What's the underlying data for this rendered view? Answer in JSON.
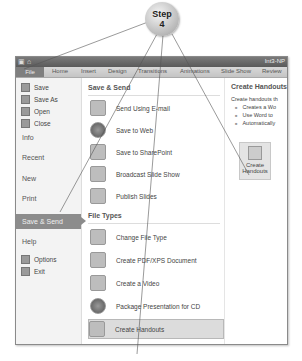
{
  "callout": {
    "line1": "Step",
    "line2": "4"
  },
  "window": {
    "title": "Int3-NP",
    "tabs": [
      "File",
      "Home",
      "Insert",
      "Design",
      "Transitions",
      "Animations",
      "Slide Show",
      "Review"
    ]
  },
  "sidebar": {
    "small_items": [
      {
        "label": "Save",
        "icon": "save-icon"
      },
      {
        "label": "Save As",
        "icon": "save-as-icon"
      },
      {
        "label": "Open",
        "icon": "open-folder-icon"
      },
      {
        "label": "Close",
        "icon": "close-file-icon"
      }
    ],
    "big_items": [
      "Info",
      "Recent",
      "New",
      "Print"
    ],
    "active_item": "Save & Send",
    "help": "Help",
    "bottom_items": [
      {
        "label": "Options",
        "icon": "options-icon"
      },
      {
        "label": "Exit",
        "icon": "exit-icon"
      }
    ]
  },
  "middle": {
    "save_send_heading": "Save & Send",
    "save_send_items": [
      {
        "label": "Send Using E-mail",
        "icon": "email-icon"
      },
      {
        "label": "Save to Web",
        "icon": "web-globe-icon"
      },
      {
        "label": "Save to SharePoint",
        "icon": "sharepoint-icon"
      },
      {
        "label": "Broadcast Slide Show",
        "icon": "broadcast-icon"
      },
      {
        "label": "Publish Slides",
        "icon": "publish-slides-icon"
      }
    ],
    "file_types_heading": "File Types",
    "file_types_items": [
      {
        "label": "Change File Type",
        "icon": "change-file-type-icon"
      },
      {
        "label": "Create PDF/XPS Document",
        "icon": "pdf-icon"
      },
      {
        "label": "Create a Video",
        "icon": "video-icon"
      },
      {
        "label": "Package Presentation for CD",
        "icon": "cd-icon"
      },
      {
        "label": "Create Handouts",
        "icon": "handouts-icon",
        "selected": true
      }
    ]
  },
  "right": {
    "title": "Create Handouts",
    "description": "Create handouts th",
    "bullets": [
      "Creates a Wo",
      "Use Word to",
      "Automatically"
    ],
    "button_line1": "Create",
    "button_line2": "Handouts"
  }
}
